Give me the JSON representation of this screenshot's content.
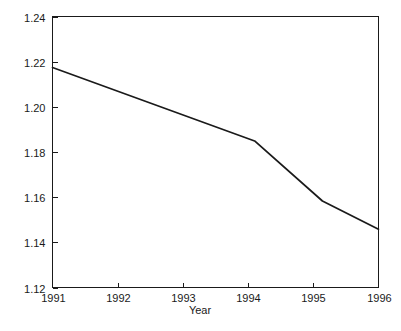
{
  "chart_data": {
    "type": "line",
    "title": "",
    "subtitle": "",
    "xlabel": "Year",
    "ylabel": "",
    "xlim": [
      1991,
      1996
    ],
    "ylim": [
      1.12,
      1.24
    ],
    "grid": false,
    "legend": false,
    "legend_position": "none",
    "x_ticks": [
      1991,
      1992,
      1993,
      1994,
      1995,
      1996
    ],
    "x_tick_labels": [
      "1991",
      "1992",
      "1993",
      "1994",
      "1995",
      "1996"
    ],
    "y_ticks": [
      1.12,
      1.14,
      1.16,
      1.18,
      1.2,
      1.22,
      1.24
    ],
    "y_tick_labels": [
      "1.12",
      "1.14",
      "1.16",
      "1.18",
      "1.20",
      "1.22",
      "1.24"
    ],
    "series": [
      {
        "name": "value",
        "color": "#1a1a1a",
        "x": [
          1991.0,
          1994.1,
          1995.14,
          1996.0
        ],
        "values": [
          1.2174,
          1.1849,
          1.1583,
          1.1458
        ]
      }
    ],
    "annotations": []
  },
  "axis": {
    "x_title": "Year"
  }
}
